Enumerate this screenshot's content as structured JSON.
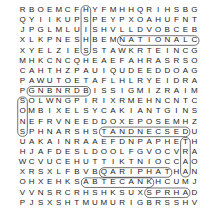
{
  "puzzle": {
    "type": "word-search",
    "rows": [
      "RBOEMCFHYFMHHQRIHSBG",
      "QYIIKUPSPEYPXOAHUFNT",
      "JPGLMLUISHVLLDVOBCEB",
      "XLKPNESHBEMNATIONALC",
      "XYELZIESSTAWKRTEINCG",
      "MHKCNCQHEAEFAHRASRSO",
      "CAHTHZPAUIQUDEEDDOAG",
      "PAWUTOETAFLHLRYEIDRA",
      "PGNBNRDBISSIGMIZRAIM",
      "SOLWNGPIRIXRMEHNCNTC",
      "OMBIXELSYCAKIANTGINS",
      "NEFRVNEEDDOXEPOSEMHZ",
      "SPHNARSHSTANDNECSEDU",
      "UAKAINRAAEFDNPAPHETH",
      "HJAFDESLDOOLFGVOCVRA",
      "WCVUCEHUTTIKTNIOCCAO",
      "XRSXLFBVBQARIPHATHAN",
      "OHXEHKSABTECANKHCUMJ",
      "VVNSRCRHSHKSUXSPRHAD",
      "PJSXSHTMUMURIGBRSSHV"
    ]
  }
}
